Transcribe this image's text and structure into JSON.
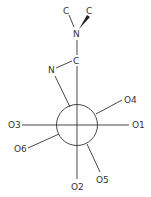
{
  "diagram": {
    "type": "Newman projection / molecular structure",
    "colors": {
      "stroke": "#333333",
      "background": "#ffffff"
    },
    "atoms": {
      "c_top_left": "C",
      "c_top_right": "C",
      "n_top": "N",
      "c_mid": "C",
      "n_left": "N"
    },
    "substituents": {
      "o1": "O1",
      "o2": "O2",
      "o3": "O3",
      "o4": "O4",
      "o5": "O5",
      "o6": "O6"
    }
  }
}
